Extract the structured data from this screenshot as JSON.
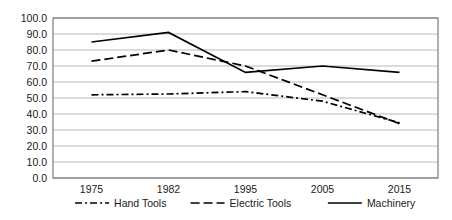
{
  "chart_data": {
    "type": "line",
    "title": "",
    "xlabel": "",
    "ylabel": "",
    "categories": [
      "1975",
      "1982",
      "1995",
      "2005",
      "2015"
    ],
    "series": [
      {
        "name": "Hand Tools",
        "style": "dash-dot",
        "color": "#000000",
        "values": [
          52.0,
          52.5,
          54.0,
          48.0,
          34.5
        ]
      },
      {
        "name": "Electric Tools",
        "style": "dashed",
        "color": "#000000",
        "values": [
          73.0,
          80.0,
          70.0,
          52.0,
          34.0
        ]
      },
      {
        "name": "Machinery",
        "style": "solid",
        "color": "#000000",
        "values": [
          85.0,
          91.0,
          66.0,
          70.0,
          66.0
        ]
      }
    ],
    "ylim": [
      0,
      100
    ],
    "ytick_step": 10,
    "ytick_labels": [
      "0.0",
      "10.0",
      "20.0",
      "30.0",
      "40.0",
      "50.0",
      "60.0",
      "70.0",
      "80.0",
      "90.0",
      "100.0"
    ],
    "grid": true,
    "legend_position": "bottom"
  },
  "axes": {
    "plot_left": 53,
    "plot_right": 438,
    "plot_top": 18,
    "plot_bottom": 178
  },
  "legend": {
    "items": [
      {
        "label": "Hand Tools",
        "style": "dash-dot"
      },
      {
        "label": "Electric Tools",
        "style": "dashed"
      },
      {
        "label": "Machinery",
        "style": "solid"
      }
    ]
  }
}
